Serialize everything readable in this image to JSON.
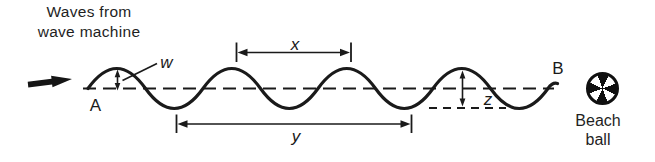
{
  "title": {
    "line1": "Waves from",
    "line2": "wave machine"
  },
  "labels": {
    "a": "A",
    "b": "B",
    "w": "w",
    "x": "x",
    "y": "y",
    "z": "z"
  },
  "beach_ball": {
    "line1": "Beach",
    "line2": "ball"
  },
  "colors": {
    "ink": "#1a1a1a",
    "background": "#ffffff"
  }
}
